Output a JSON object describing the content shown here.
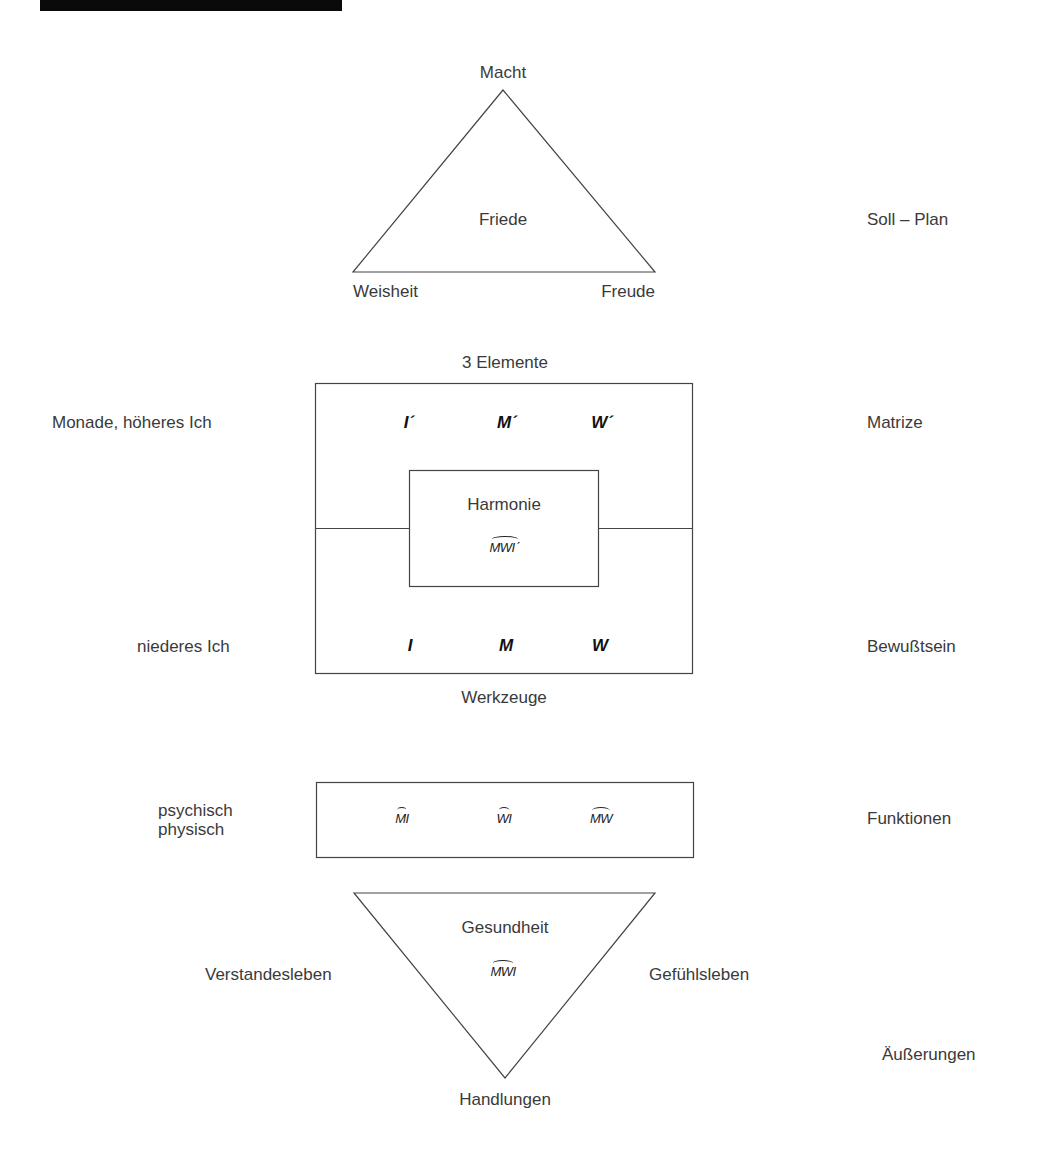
{
  "header": {
    "bar_color": "#0a0a0a"
  },
  "top_triangle": {
    "apex_label": "Macht",
    "center_label": "Friede",
    "left_label": "Weisheit",
    "right_label": "Freude"
  },
  "middle_box": {
    "top_label": "3 Elemente",
    "bottom_label": "Werkzeuge",
    "upper_symbols": [
      "I´",
      "M´",
      "W´"
    ],
    "lower_symbols": [
      "I",
      "M",
      "W"
    ],
    "inner_box": {
      "title": "Harmonie",
      "symbol": "MWI",
      "symbol_suffix": "´"
    }
  },
  "functions_box": {
    "symbols": [
      "MI",
      "WI",
      "MW"
    ]
  },
  "bottom_triangle": {
    "center_label": "Gesundheit",
    "symbol": "MWI",
    "bottom_label": "Handlungen",
    "left_label": "Verstandesleben",
    "right_label": "Gefühlsleben"
  },
  "left_labels": {
    "monade": "Monade, höheres Ich",
    "niederes": "niederes Ich",
    "psychisch": "psychisch",
    "physisch": "physisch"
  },
  "right_labels": {
    "soll_plan": "Soll – Plan",
    "matrize": "Matrize",
    "bewusstsein": "Bewußtsein",
    "funktionen": "Funktionen",
    "aeusserungen": "Äußerungen"
  }
}
